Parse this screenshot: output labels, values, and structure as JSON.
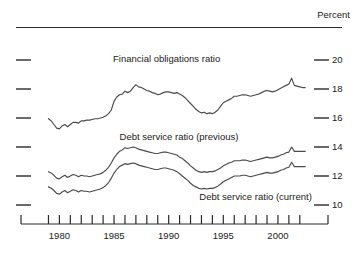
{
  "header": {
    "title": "",
    "unit_label": "Percent"
  },
  "chart_data": {
    "type": "line",
    "title": "",
    "subtitle": "",
    "xlabel": "",
    "ylabel": "Percent",
    "ylim": [
      9,
      21
    ],
    "xlim": [
      1978.5,
      2002.75
    ],
    "grid": false,
    "legend_position": "inline-annotations",
    "ytick_labels": [
      "20",
      "18",
      "16",
      "14",
      "12",
      "10"
    ],
    "ytick_values": [
      20,
      18,
      16,
      14,
      12,
      10
    ],
    "xtick_labels": [
      "1980",
      "1985",
      "1990",
      "1995",
      "2000"
    ],
    "xtick_values": [
      1980,
      1985,
      1990,
      1995,
      2000
    ],
    "xtick_minor_step": 1,
    "annotations": [
      {
        "text": "Financial obligations ratio",
        "x": 1985.0,
        "y": 20.0
      },
      {
        "text": "Debt service ratio (previous)",
        "x": 1985.6,
        "y": 14.6
      },
      {
        "text": "Debt service ratio (current)",
        "x": 1992.9,
        "y": 10.5
      }
    ],
    "series": [
      {
        "name": "Financial obligations ratio",
        "color": "#4a4a4a",
        "x": [
          1979.0,
          1979.25,
          1979.5,
          1979.75,
          1980.0,
          1980.25,
          1980.5,
          1980.75,
          1981.0,
          1981.25,
          1981.5,
          1981.75,
          1982.0,
          1982.25,
          1982.5,
          1982.75,
          1983.0,
          1983.25,
          1983.5,
          1983.75,
          1984.0,
          1984.25,
          1984.5,
          1984.75,
          1985.0,
          1985.25,
          1985.5,
          1985.75,
          1986.0,
          1986.25,
          1986.5,
          1986.75,
          1987.0,
          1987.25,
          1987.5,
          1987.75,
          1988.0,
          1988.25,
          1988.5,
          1988.75,
          1989.0,
          1989.25,
          1989.5,
          1989.75,
          1990.0,
          1990.25,
          1990.5,
          1990.75,
          1991.0,
          1991.25,
          1991.5,
          1991.75,
          1992.0,
          1992.25,
          1992.5,
          1992.75,
          1993.0,
          1993.25,
          1993.5,
          1993.75,
          1994.0,
          1994.25,
          1994.5,
          1994.75,
          1995.0,
          1995.25,
          1995.5,
          1995.75,
          1996.0,
          1996.25,
          1996.5,
          1996.75,
          1997.0,
          1997.25,
          1997.5,
          1997.75,
          1998.0,
          1998.25,
          1998.5,
          1998.75,
          1999.0,
          1999.25,
          1999.5,
          1999.75,
          2000.0,
          2000.25,
          2000.5,
          2000.75,
          2001.0,
          2001.25,
          2001.5,
          2001.75,
          2002.0,
          2002.25,
          2002.5
        ],
        "y": [
          15.95,
          15.8,
          15.55,
          15.3,
          15.25,
          15.45,
          15.55,
          15.4,
          15.55,
          15.7,
          15.7,
          15.65,
          15.8,
          15.8,
          15.85,
          15.85,
          15.9,
          15.95,
          15.95,
          16.0,
          16.05,
          16.15,
          16.3,
          16.55,
          17.15,
          17.45,
          17.6,
          17.65,
          17.85,
          17.75,
          17.85,
          18.1,
          18.3,
          18.15,
          18.1,
          18.0,
          17.9,
          17.85,
          17.75,
          17.7,
          17.6,
          17.65,
          17.75,
          17.8,
          17.8,
          17.75,
          17.7,
          17.75,
          17.65,
          17.55,
          17.4,
          17.2,
          17.0,
          16.8,
          16.6,
          16.45,
          16.35,
          16.4,
          16.3,
          16.35,
          16.3,
          16.4,
          16.55,
          16.8,
          17.05,
          17.15,
          17.25,
          17.35,
          17.5,
          17.5,
          17.55,
          17.6,
          17.6,
          17.55,
          17.5,
          17.55,
          17.6,
          17.65,
          17.75,
          17.85,
          17.9,
          17.85,
          17.8,
          17.85,
          17.95,
          18.05,
          18.15,
          18.25,
          18.35,
          18.75,
          18.25,
          18.2,
          18.15,
          18.1,
          18.1
        ]
      },
      {
        "name": "Debt service ratio (previous)",
        "color": "#4a4a4a",
        "x": [
          1979.0,
          1979.25,
          1979.5,
          1979.75,
          1980.0,
          1980.25,
          1980.5,
          1980.75,
          1981.0,
          1981.25,
          1981.5,
          1981.75,
          1982.0,
          1982.25,
          1982.5,
          1982.75,
          1983.0,
          1983.25,
          1983.5,
          1983.75,
          1984.0,
          1984.25,
          1984.5,
          1984.75,
          1985.0,
          1985.25,
          1985.5,
          1985.75,
          1986.0,
          1986.25,
          1986.5,
          1986.75,
          1987.0,
          1987.25,
          1987.5,
          1987.75,
          1988.0,
          1988.25,
          1988.5,
          1988.75,
          1989.0,
          1989.25,
          1989.5,
          1989.75,
          1990.0,
          1990.25,
          1990.5,
          1990.75,
          1991.0,
          1991.25,
          1991.5,
          1991.75,
          1992.0,
          1992.25,
          1992.5,
          1992.75,
          1993.0,
          1993.25,
          1993.5,
          1993.75,
          1994.0,
          1994.25,
          1994.5,
          1994.75,
          1995.0,
          1995.25,
          1995.5,
          1995.75,
          1996.0,
          1996.25,
          1996.5,
          1996.75,
          1997.0,
          1997.25,
          1997.5,
          1997.75,
          1998.0,
          1998.25,
          1998.5,
          1998.75,
          1999.0,
          1999.25,
          1999.5,
          1999.75,
          2000.0,
          2000.25,
          2000.5,
          2000.75,
          2001.0,
          2001.25,
          2001.5,
          2001.75,
          2002.0,
          2002.25,
          2002.5
        ],
        "y": [
          12.3,
          12.2,
          12.05,
          11.85,
          11.8,
          11.95,
          12.05,
          11.9,
          12.0,
          12.1,
          12.05,
          11.95,
          12.05,
          12.0,
          12.0,
          11.95,
          12.0,
          12.05,
          12.1,
          12.15,
          12.25,
          12.4,
          12.6,
          12.9,
          13.25,
          13.5,
          13.7,
          13.8,
          13.95,
          13.9,
          13.95,
          14.0,
          13.95,
          13.85,
          13.8,
          13.75,
          13.7,
          13.65,
          13.6,
          13.55,
          13.55,
          13.6,
          13.65,
          13.65,
          13.6,
          13.55,
          13.5,
          13.45,
          13.3,
          13.2,
          13.05,
          12.9,
          12.7,
          12.55,
          12.4,
          12.3,
          12.25,
          12.3,
          12.25,
          12.3,
          12.3,
          12.35,
          12.45,
          12.55,
          12.7,
          12.8,
          12.9,
          12.95,
          13.05,
          13.05,
          13.05,
          13.1,
          13.1,
          13.05,
          13.0,
          13.05,
          13.1,
          13.15,
          13.2,
          13.25,
          13.3,
          13.25,
          13.25,
          13.3,
          13.35,
          13.45,
          13.5,
          13.6,
          13.65,
          14.0,
          13.7,
          13.7,
          13.7,
          13.7,
          13.7
        ]
      },
      {
        "name": "Debt service ratio (current)",
        "color": "#4a4a4a",
        "x": [
          1979.0,
          1979.25,
          1979.5,
          1979.75,
          1980.0,
          1980.25,
          1980.5,
          1980.75,
          1981.0,
          1981.25,
          1981.5,
          1981.75,
          1982.0,
          1982.25,
          1982.5,
          1982.75,
          1983.0,
          1983.25,
          1983.5,
          1983.75,
          1984.0,
          1984.25,
          1984.5,
          1984.75,
          1985.0,
          1985.25,
          1985.5,
          1985.75,
          1986.0,
          1986.25,
          1986.5,
          1986.75,
          1987.0,
          1987.25,
          1987.5,
          1987.75,
          1988.0,
          1988.25,
          1988.5,
          1988.75,
          1989.0,
          1989.25,
          1989.5,
          1989.75,
          1990.0,
          1990.25,
          1990.5,
          1990.75,
          1991.0,
          1991.25,
          1991.5,
          1991.75,
          1992.0,
          1992.25,
          1992.5,
          1992.75,
          1993.0,
          1993.25,
          1993.5,
          1993.75,
          1994.0,
          1994.25,
          1994.5,
          1994.75,
          1995.0,
          1995.25,
          1995.5,
          1995.75,
          1996.0,
          1996.25,
          1996.5,
          1996.75,
          1997.0,
          1997.25,
          1997.5,
          1997.75,
          1998.0,
          1998.25,
          1998.5,
          1998.75,
          1999.0,
          1999.25,
          1999.5,
          1999.75,
          2000.0,
          2000.25,
          2000.5,
          2000.75,
          2001.0,
          2001.25,
          2001.5,
          2001.75,
          2002.0,
          2002.25,
          2002.5
        ],
        "y": [
          11.25,
          11.15,
          11.0,
          10.8,
          10.75,
          10.9,
          11.0,
          10.85,
          10.95,
          11.05,
          11.0,
          10.9,
          11.0,
          10.95,
          10.95,
          10.9,
          10.95,
          11.0,
          11.05,
          11.1,
          11.2,
          11.35,
          11.55,
          11.85,
          12.2,
          12.45,
          12.65,
          12.75,
          12.85,
          12.8,
          12.85,
          12.9,
          12.85,
          12.75,
          12.7,
          12.65,
          12.6,
          12.55,
          12.5,
          12.45,
          12.45,
          12.5,
          12.55,
          12.55,
          12.5,
          12.45,
          12.4,
          12.3,
          12.15,
          12.0,
          11.85,
          11.7,
          11.5,
          11.35,
          11.25,
          11.15,
          11.1,
          11.15,
          11.1,
          11.15,
          11.15,
          11.2,
          11.3,
          11.45,
          11.6,
          11.7,
          11.8,
          11.9,
          12.0,
          12.0,
          12.0,
          12.05,
          12.05,
          12.0,
          11.95,
          12.0,
          12.05,
          12.1,
          12.15,
          12.2,
          12.25,
          12.2,
          12.2,
          12.25,
          12.3,
          12.4,
          12.45,
          12.55,
          12.6,
          12.95,
          12.65,
          12.65,
          12.65,
          12.65,
          12.65
        ]
      }
    ]
  }
}
